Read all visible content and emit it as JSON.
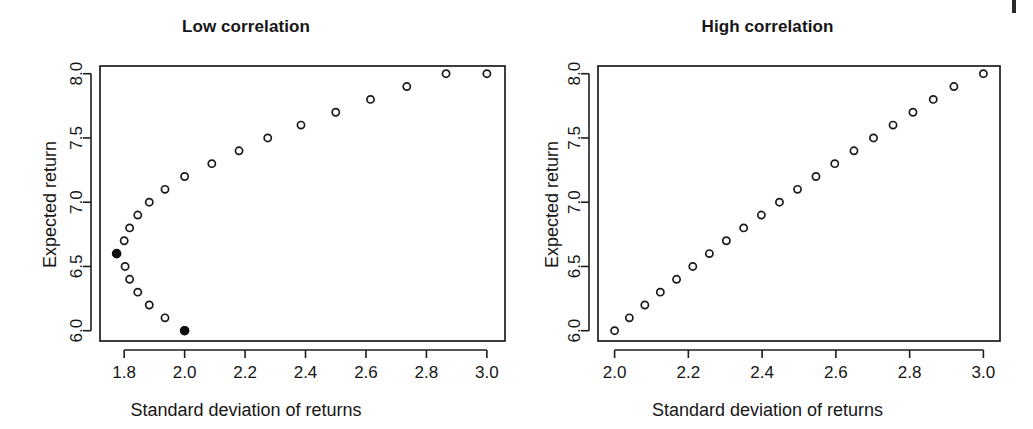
{
  "figure": {
    "background_color": "#ffffff",
    "point_color": "#1a1a1a",
    "highlight_color": "#101010",
    "axis_color": "#1d1d1d",
    "artifact_name": "scan-artifact"
  },
  "panels": [
    {
      "id": "low",
      "title": "Low correlation",
      "xlabel": "Standard deviation of returns",
      "ylabel": "Expected return"
    },
    {
      "id": "high",
      "title": "High correlation",
      "xlabel": "Standard deviation of returns",
      "ylabel": "Expected return"
    }
  ],
  "chart_data": [
    {
      "type": "scatter",
      "title": "Low correlation",
      "xlabel": "Standard deviation of returns",
      "ylabel": "Expected return",
      "xlim": [
        1.72,
        3.06
      ],
      "ylim": [
        5.92,
        8.06
      ],
      "xticks": [
        1.8,
        2.0,
        2.2,
        2.4,
        2.6,
        2.8,
        3.0
      ],
      "xtick_labels": [
        "1.8",
        "2.0",
        "2.2",
        "2.4",
        "2.6",
        "2.8",
        "3.0"
      ],
      "yticks": [
        6.0,
        6.5,
        7.0,
        7.5,
        8.0
      ],
      "ytick_labels": [
        "6.0",
        "6.5",
        "7.0",
        "7.5",
        "8.0"
      ],
      "grid": false,
      "legend": null,
      "marker": "open-circle",
      "series": [
        {
          "name": "efficient frontier (low correlation)",
          "marker": "open-circle",
          "x": [
            2.0,
            1.935,
            1.883,
            1.845,
            1.818,
            1.803,
            1.775,
            1.8,
            1.818,
            1.845,
            1.883,
            1.935,
            2.0,
            2.09,
            2.18,
            2.275,
            2.385,
            2.5,
            2.615,
            2.735,
            2.865,
            3.0
          ],
          "y": [
            6.0,
            6.1,
            6.2,
            6.3,
            6.4,
            6.5,
            6.6,
            6.7,
            6.8,
            6.9,
            7.0,
            7.1,
            7.2,
            7.3,
            7.4,
            7.5,
            7.6,
            7.7,
            7.8,
            7.9,
            8.0,
            8.0
          ]
        }
      ],
      "highlighted_points": [
        {
          "name": "equal-weight portfolio",
          "x": 2.0,
          "y": 6.0,
          "marker": "filled-circle"
        },
        {
          "name": "minimum-variance portfolio",
          "x": 1.775,
          "y": 6.6,
          "marker": "filled-circle"
        }
      ]
    },
    {
      "type": "scatter",
      "title": "High correlation",
      "xlabel": "Standard deviation of returns",
      "ylabel": "Expected return",
      "xlim": [
        1.955,
        3.045
      ],
      "ylim": [
        5.92,
        8.06
      ],
      "xticks": [
        2.0,
        2.2,
        2.4,
        2.6,
        2.8,
        3.0
      ],
      "xtick_labels": [
        "2.0",
        "2.2",
        "2.4",
        "2.6",
        "2.8",
        "3.0"
      ],
      "yticks": [
        6.0,
        6.5,
        7.0,
        7.5,
        8.0
      ],
      "ytick_labels": [
        "6.0",
        "6.5",
        "7.0",
        "7.5",
        "8.0"
      ],
      "grid": false,
      "legend": null,
      "marker": "open-circle",
      "series": [
        {
          "name": "efficient frontier (high correlation)",
          "marker": "open-circle",
          "x": [
            2.0,
            2.04,
            2.082,
            2.124,
            2.168,
            2.212,
            2.257,
            2.303,
            2.35,
            2.398,
            2.447,
            2.496,
            2.546,
            2.597,
            2.649,
            2.702,
            2.755,
            2.809,
            2.864,
            2.92,
            3.0
          ],
          "y": [
            6.0,
            6.1,
            6.2,
            6.3,
            6.4,
            6.5,
            6.6,
            6.7,
            6.8,
            6.9,
            7.0,
            7.1,
            7.2,
            7.3,
            7.4,
            7.5,
            7.6,
            7.7,
            7.8,
            7.9,
            8.0
          ]
        }
      ],
      "highlighted_points": []
    }
  ]
}
